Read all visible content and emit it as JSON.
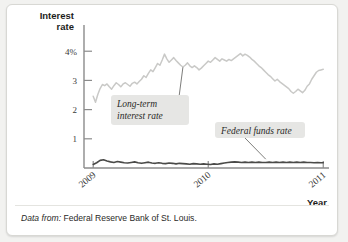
{
  "figure": {
    "card_background": "#ffffff",
    "page_background": "#f2f2f0"
  },
  "caption": {
    "prefix": "Data from:",
    "text": "Federal Reserve Bank of St. Louis."
  },
  "chart_data": {
    "type": "line",
    "title": "",
    "ylabel_line1": "Interest",
    "ylabel_line2": "rate",
    "xlabel": "Year",
    "ylim": [
      0,
      4.35
    ],
    "xlim": [
      2008.92,
      2011.05
    ],
    "grid": false,
    "legend_position": "inline-annotations",
    "ytick_values": [
      1,
      2,
      3,
      4
    ],
    "ytick_labels": [
      "1",
      "2",
      "3",
      "4%"
    ],
    "xtick_values": [
      2009,
      2010,
      2011
    ],
    "xtick_labels": [
      "2009",
      "2010",
      "2011"
    ],
    "annotations": [
      {
        "name": "long-term-interest-rate",
        "line1": "Long-term",
        "line2": "interest rate",
        "box_color": "#e6e6e4",
        "points_to_x": 2009.78,
        "points_to_y": 3.45
      },
      {
        "name": "federal-funds-rate",
        "line1": "Federal funds rate",
        "line2": "",
        "box_color": "#e6e6e4",
        "points_to_x": 2010.5,
        "points_to_y": 0.2
      }
    ],
    "series": [
      {
        "name": "Long-term interest rate",
        "color": "#c9c9c7",
        "x": [
          2009.0,
          2009.02,
          2009.04,
          2009.06,
          2009.08,
          2009.1,
          2009.12,
          2009.14,
          2009.16,
          2009.18,
          2009.2,
          2009.22,
          2009.24,
          2009.26,
          2009.28,
          2009.3,
          2009.32,
          2009.34,
          2009.36,
          2009.38,
          2009.4,
          2009.42,
          2009.44,
          2009.46,
          2009.48,
          2009.5,
          2009.52,
          2009.54,
          2009.56,
          2009.58,
          2009.6,
          2009.62,
          2009.64,
          2009.66,
          2009.68,
          2009.7,
          2009.72,
          2009.74,
          2009.76,
          2009.78,
          2009.8,
          2009.82,
          2009.84,
          2009.86,
          2009.88,
          2009.9,
          2009.92,
          2009.94,
          2009.96,
          2009.98,
          2010.0,
          2010.02,
          2010.04,
          2010.06,
          2010.08,
          2010.1,
          2010.12,
          2010.14,
          2010.16,
          2010.18,
          2010.2,
          2010.22,
          2010.24,
          2010.26,
          2010.28,
          2010.3,
          2010.32,
          2010.34,
          2010.36,
          2010.38,
          2010.4,
          2010.42,
          2010.44,
          2010.46,
          2010.48,
          2010.5,
          2010.52,
          2010.54,
          2010.56,
          2010.58,
          2010.6,
          2010.62,
          2010.64,
          2010.66,
          2010.68,
          2010.7,
          2010.72,
          2010.74,
          2010.76,
          2010.78,
          2010.8,
          2010.82,
          2010.84,
          2010.86,
          2010.88,
          2010.9,
          2010.92,
          2010.94,
          2010.96,
          2010.98,
          2011.0
        ],
        "y": [
          2.46,
          2.25,
          2.52,
          2.72,
          2.86,
          2.82,
          2.88,
          2.78,
          2.7,
          2.82,
          2.92,
          2.86,
          2.78,
          2.88,
          2.92,
          2.86,
          2.8,
          2.9,
          2.94,
          2.88,
          2.96,
          3.04,
          3.16,
          3.1,
          3.24,
          3.36,
          3.3,
          3.44,
          3.58,
          3.52,
          3.7,
          3.9,
          3.74,
          3.62,
          3.7,
          3.78,
          3.68,
          3.6,
          3.52,
          3.46,
          3.52,
          3.6,
          3.5,
          3.44,
          3.5,
          3.44,
          3.36,
          3.42,
          3.5,
          3.58,
          3.66,
          3.62,
          3.7,
          3.78,
          3.72,
          3.66,
          3.74,
          3.7,
          3.66,
          3.72,
          3.68,
          3.74,
          3.8,
          3.86,
          3.92,
          3.84,
          3.9,
          3.86,
          3.8,
          3.72,
          3.66,
          3.58,
          3.5,
          3.44,
          3.36,
          3.28,
          3.2,
          3.14,
          3.06,
          2.98,
          3.04,
          2.96,
          2.9,
          2.84,
          2.78,
          2.72,
          2.62,
          2.56,
          2.62,
          2.7,
          2.64,
          2.58,
          2.66,
          2.8,
          2.88,
          3.04,
          3.16,
          3.28,
          3.34,
          3.36,
          3.38
        ]
      },
      {
        "name": "Federal funds rate",
        "color": "#4a4a48",
        "x": [
          2009.0,
          2009.03,
          2009.06,
          2009.09,
          2009.12,
          2009.15,
          2009.18,
          2009.21,
          2009.24,
          2009.27,
          2009.3,
          2009.33,
          2009.36,
          2009.39,
          2009.42,
          2009.45,
          2009.48,
          2009.51,
          2009.54,
          2009.57,
          2009.6,
          2009.63,
          2009.66,
          2009.69,
          2009.72,
          2009.75,
          2009.78,
          2009.81,
          2009.84,
          2009.87,
          2009.9,
          2009.93,
          2009.96,
          2009.99,
          2010.02,
          2010.05,
          2010.08,
          2010.11,
          2010.14,
          2010.17,
          2010.2,
          2010.23,
          2010.26,
          2010.29,
          2010.32,
          2010.35,
          2010.38,
          2010.41,
          2010.44,
          2010.47,
          2010.5,
          2010.53,
          2010.56,
          2010.59,
          2010.62,
          2010.65,
          2010.68,
          2010.71,
          2010.74,
          2010.77,
          2010.8,
          2010.83,
          2010.86,
          2010.89,
          2010.92,
          2010.95,
          2010.98,
          2011.0
        ],
        "y": [
          0.12,
          0.18,
          0.26,
          0.28,
          0.24,
          0.21,
          0.19,
          0.22,
          0.2,
          0.18,
          0.17,
          0.19,
          0.21,
          0.18,
          0.16,
          0.18,
          0.2,
          0.17,
          0.16,
          0.18,
          0.16,
          0.15,
          0.17,
          0.16,
          0.14,
          0.16,
          0.15,
          0.14,
          0.13,
          0.15,
          0.14,
          0.13,
          0.14,
          0.13,
          0.12,
          0.14,
          0.13,
          0.15,
          0.17,
          0.19,
          0.2,
          0.21,
          0.2,
          0.19,
          0.2,
          0.19,
          0.2,
          0.19,
          0.2,
          0.19,
          0.19,
          0.2,
          0.19,
          0.2,
          0.19,
          0.2,
          0.19,
          0.2,
          0.19,
          0.2,
          0.19,
          0.2,
          0.19,
          0.19,
          0.18,
          0.19,
          0.18,
          0.18
        ]
      }
    ]
  }
}
